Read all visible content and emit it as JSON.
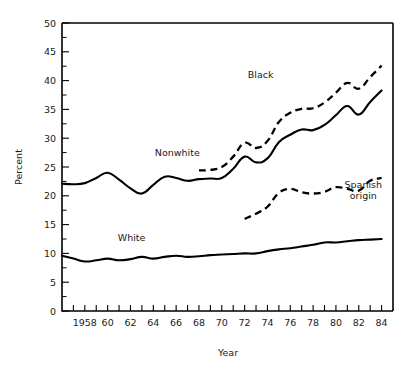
{
  "chart_data": {
    "type": "line",
    "title": "",
    "xlabel": "Year",
    "ylabel": "Percent",
    "xlim": [
      1956,
      1985
    ],
    "ylim": [
      0,
      50
    ],
    "grid": false,
    "legend_position": "inline-annotations",
    "x_tick_labels": [
      "1958",
      "60",
      "62",
      "64",
      "66",
      "68",
      "70",
      "72",
      "74",
      "76",
      "78",
      "80",
      "82",
      "84"
    ],
    "x_tick_values": [
      1958,
      1960,
      1962,
      1964,
      1966,
      1968,
      1970,
      1972,
      1974,
      1976,
      1978,
      1980,
      1982,
      1984
    ],
    "x_minor_step": 1,
    "y_tick_labels": [
      "0",
      "5",
      "10",
      "15",
      "20",
      "25",
      "30",
      "35",
      "40",
      "45",
      "50"
    ],
    "y_tick_values": [
      0,
      5,
      10,
      15,
      20,
      25,
      30,
      35,
      40,
      45,
      50
    ],
    "y_minor_step": 2.5,
    "series": [
      {
        "name": "Nonwhite",
        "style": "solid",
        "label_x": 1966.1,
        "label_y": 26.9,
        "x": [
          1956,
          1957,
          1958,
          1959,
          1960,
          1961,
          1962,
          1963,
          1964,
          1965,
          1966,
          1967,
          1968,
          1969,
          1970,
          1971,
          1972,
          1973,
          1974,
          1975,
          1976,
          1977,
          1978,
          1979,
          1980,
          1981,
          1982,
          1983,
          1984
        ],
        "values": [
          22.1,
          22.0,
          22.2,
          23.1,
          24.0,
          22.8,
          21.3,
          20.4,
          21.9,
          23.3,
          23.1,
          22.6,
          22.9,
          23.0,
          23.1,
          24.7,
          26.8,
          25.8,
          26.5,
          29.3,
          30.6,
          31.5,
          31.4,
          32.3,
          34.0,
          35.6,
          34.1,
          36.3,
          38.3
        ]
      },
      {
        "name": "Black",
        "style": "dashed",
        "label_x": 1973.4,
        "label_y": 40.5,
        "x": [
          1968,
          1969,
          1970,
          1971,
          1972,
          1973,
          1974,
          1975,
          1976,
          1977,
          1978,
          1979,
          1980,
          1981,
          1982,
          1983,
          1984
        ],
        "values": [
          24.4,
          24.5,
          25.0,
          26.8,
          29.2,
          28.3,
          29.5,
          32.8,
          34.4,
          35.1,
          35.2,
          36.2,
          37.9,
          39.6,
          38.6,
          40.6,
          42.6
        ]
      },
      {
        "name": "Spanish\norigin",
        "name_line1": "Spanish",
        "name_line2": "origin",
        "style": "dashed",
        "label_x": 1982.4,
        "label_y": 21.3,
        "x": [
          1972,
          1973,
          1974,
          1975,
          1976,
          1977,
          1978,
          1979,
          1980,
          1981,
          1982,
          1983,
          1984
        ],
        "values": [
          16.0,
          16.9,
          18.1,
          20.5,
          21.2,
          20.6,
          20.4,
          20.7,
          21.5,
          21.2,
          20.9,
          22.6,
          23.1
        ]
      },
      {
        "name": "White",
        "style": "solid",
        "label_x": 1962.1,
        "label_y": 12.1,
        "x": [
          1956,
          1957,
          1958,
          1959,
          1960,
          1961,
          1962,
          1963,
          1964,
          1965,
          1966,
          1967,
          1968,
          1969,
          1970,
          1971,
          1972,
          1973,
          1974,
          1975,
          1976,
          1977,
          1978,
          1979,
          1980,
          1981,
          1982,
          1983,
          1984
        ],
        "values": [
          9.6,
          9.1,
          8.6,
          8.8,
          9.1,
          8.8,
          9.0,
          9.4,
          9.1,
          9.4,
          9.6,
          9.4,
          9.5,
          9.7,
          9.8,
          9.9,
          10.0,
          10.0,
          10.4,
          10.7,
          10.9,
          11.2,
          11.5,
          11.9,
          11.9,
          12.1,
          12.3,
          12.4,
          12.5
        ]
      }
    ]
  },
  "plot": {
    "left": 62,
    "right": 393,
    "top": 23,
    "bottom": 311
  }
}
